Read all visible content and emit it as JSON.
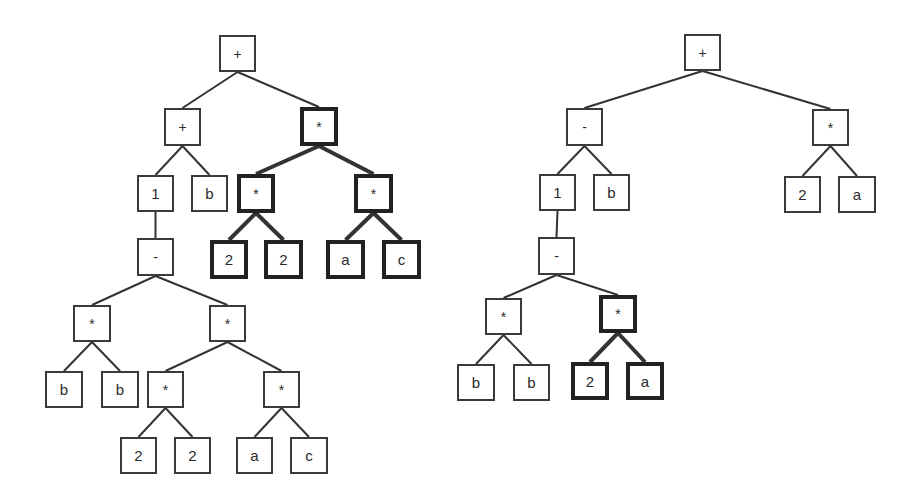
{
  "diagram": {
    "title": "",
    "line_color": "#333333",
    "trees": [
      {
        "name": "left-expression-tree",
        "nodes": [
          {
            "id": "L0",
            "label": "+",
            "x": 219,
            "y": 35,
            "w": 37,
            "h": 37,
            "bold": false
          },
          {
            "id": "L1",
            "label": "+",
            "x": 164,
            "y": 108,
            "w": 37,
            "h": 38,
            "bold": false,
            "parent": "L0"
          },
          {
            "id": "L2",
            "label": "*",
            "x": 300,
            "y": 107,
            "w": 38,
            "h": 39,
            "bold": true,
            "parent": "L0"
          },
          {
            "id": "L3",
            "label": "1",
            "x": 137,
            "y": 175,
            "w": 37,
            "h": 37,
            "bold": false,
            "parent": "L1"
          },
          {
            "id": "L4",
            "label": "b",
            "x": 191,
            "y": 175,
            "w": 37,
            "h": 37,
            "bold": false,
            "parent": "L1"
          },
          {
            "id": "L5",
            "label": "*",
            "x": 237,
            "y": 174,
            "w": 38,
            "h": 39,
            "bold": true,
            "parent": "L2"
          },
          {
            "id": "L6",
            "label": "*",
            "x": 354,
            "y": 174,
            "w": 39,
            "h": 39,
            "bold": true,
            "parent": "L2"
          },
          {
            "id": "L7",
            "label": "2",
            "x": 210,
            "y": 240,
            "w": 38,
            "h": 39,
            "bold": true,
            "parent": "L5"
          },
          {
            "id": "L8",
            "label": "2",
            "x": 264,
            "y": 240,
            "w": 39,
            "h": 39,
            "bold": true,
            "parent": "L5"
          },
          {
            "id": "L9",
            "label": "a",
            "x": 326,
            "y": 240,
            "w": 39,
            "h": 39,
            "bold": true,
            "parent": "L6"
          },
          {
            "id": "L10",
            "label": "c",
            "x": 382,
            "y": 240,
            "w": 39,
            "h": 39,
            "bold": true,
            "parent": "L6"
          },
          {
            "id": "L11",
            "label": "-",
            "x": 137,
            "y": 238,
            "w": 37,
            "h": 38,
            "bold": false,
            "parent": "L3"
          },
          {
            "id": "L12",
            "label": "*",
            "x": 73,
            "y": 305,
            "w": 38,
            "h": 37,
            "bold": false,
            "parent": "L11"
          },
          {
            "id": "L13",
            "label": "*",
            "x": 209,
            "y": 305,
            "w": 37,
            "h": 37,
            "bold": false,
            "parent": "L11"
          },
          {
            "id": "L14",
            "label": "b",
            "x": 45,
            "y": 371,
            "w": 38,
            "h": 37,
            "bold": false,
            "parent": "L12"
          },
          {
            "id": "L15",
            "label": "b",
            "x": 101,
            "y": 371,
            "w": 38,
            "h": 37,
            "bold": false,
            "parent": "L12"
          },
          {
            "id": "L16",
            "label": "*",
            "x": 147,
            "y": 371,
            "w": 37,
            "h": 37,
            "bold": false,
            "parent": "L13"
          },
          {
            "id": "L17",
            "label": "*",
            "x": 263,
            "y": 371,
            "w": 37,
            "h": 37,
            "bold": false,
            "parent": "L13"
          },
          {
            "id": "L18",
            "label": "2",
            "x": 120,
            "y": 437,
            "w": 37,
            "h": 37,
            "bold": false,
            "parent": "L16"
          },
          {
            "id": "L19",
            "label": "2",
            "x": 174,
            "y": 437,
            "w": 37,
            "h": 37,
            "bold": false,
            "parent": "L16"
          },
          {
            "id": "L20",
            "label": "a",
            "x": 236,
            "y": 437,
            "w": 37,
            "h": 37,
            "bold": false,
            "parent": "L17"
          },
          {
            "id": "L21",
            "label": "c",
            "x": 290,
            "y": 437,
            "w": 38,
            "h": 37,
            "bold": false,
            "parent": "L17"
          }
        ]
      },
      {
        "name": "right-expression-tree",
        "nodes": [
          {
            "id": "R0",
            "label": "+",
            "x": 684,
            "y": 34,
            "w": 37,
            "h": 37,
            "bold": false
          },
          {
            "id": "R1",
            "label": "-",
            "x": 566,
            "y": 108,
            "w": 37,
            "h": 38,
            "bold": false,
            "parent": "R0"
          },
          {
            "id": "R2",
            "label": "*",
            "x": 812,
            "y": 109,
            "w": 37,
            "h": 37,
            "bold": false,
            "parent": "R0"
          },
          {
            "id": "R3",
            "label": "1",
            "x": 539,
            "y": 174,
            "w": 37,
            "h": 37,
            "bold": false,
            "parent": "R1"
          },
          {
            "id": "R4",
            "label": "b",
            "x": 593,
            "y": 174,
            "w": 37,
            "h": 37,
            "bold": false,
            "parent": "R1"
          },
          {
            "id": "R5",
            "label": "2",
            "x": 784,
            "y": 176,
            "w": 37,
            "h": 37,
            "bold": false,
            "parent": "R2"
          },
          {
            "id": "R6",
            "label": "a",
            "x": 838,
            "y": 176,
            "w": 38,
            "h": 37,
            "bold": false,
            "parent": "R2"
          },
          {
            "id": "R7",
            "label": "-",
            "x": 538,
            "y": 237,
            "w": 37,
            "h": 38,
            "bold": false,
            "parent": "R3"
          },
          {
            "id": "R8",
            "label": "*",
            "x": 485,
            "y": 298,
            "w": 37,
            "h": 37,
            "bold": false,
            "parent": "R7"
          },
          {
            "id": "R9",
            "label": "*",
            "x": 599,
            "y": 295,
            "w": 38,
            "h": 38,
            "bold": true,
            "parent": "R7"
          },
          {
            "id": "R10",
            "label": "b",
            "x": 457,
            "y": 364,
            "w": 38,
            "h": 37,
            "bold": false,
            "parent": "R8"
          },
          {
            "id": "R11",
            "label": "b",
            "x": 513,
            "y": 364,
            "w": 37,
            "h": 37,
            "bold": false,
            "parent": "R8"
          },
          {
            "id": "R12",
            "label": "2",
            "x": 571,
            "y": 362,
            "w": 38,
            "h": 38,
            "bold": true,
            "parent": "R9"
          },
          {
            "id": "R13",
            "label": "a",
            "x": 626,
            "y": 362,
            "w": 38,
            "h": 38,
            "bold": true,
            "parent": "R9"
          }
        ]
      }
    ]
  }
}
